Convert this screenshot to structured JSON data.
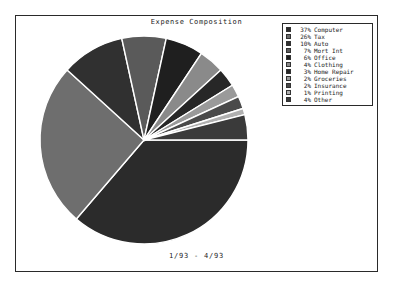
{
  "chart_data": {
    "type": "pie",
    "title": "Expense Composition",
    "caption": "1/93  -  4/93",
    "legend_position": "top-right",
    "start_angle_deg": 0,
    "direction": "clockwise",
    "categories": [
      "Computer",
      "Tax",
      "Auto",
      "Mort Int",
      "Office",
      "Clothing",
      "Home Repair",
      "Groceries",
      "Insurance",
      "Printing",
      "Other"
    ],
    "values": [
      37,
      26,
      10,
      7,
      6,
      4,
      3,
      2,
      2,
      1,
      4
    ],
    "value_suffix": "%",
    "slice_colors": [
      "#2b2b2b",
      "#6e6e6e",
      "#303030",
      "#5a5a5a",
      "#1f1f1f",
      "#8a8a8a",
      "#272727",
      "#9a9a9a",
      "#4a4a4a",
      "#b0b0b0",
      "#3a3a3a"
    ],
    "separator_color": "#ffffff"
  },
  "legend": {
    "entries": [
      {
        "pct": "37%",
        "label": "Computer",
        "color": "#2b2b2b"
      },
      {
        "pct": "26%",
        "label": "Tax",
        "color": "#6e6e6e"
      },
      {
        "pct": "10%",
        "label": "Auto",
        "color": "#303030"
      },
      {
        "pct": "7%",
        "label": "Mort Int",
        "color": "#5a5a5a"
      },
      {
        "pct": "6%",
        "label": "Office",
        "color": "#1f1f1f"
      },
      {
        "pct": "4%",
        "label": "Clothing",
        "color": "#8a8a8a"
      },
      {
        "pct": "3%",
        "label": "Home Repair",
        "color": "#272727"
      },
      {
        "pct": "2%",
        "label": "Groceries",
        "color": "#9a9a9a"
      },
      {
        "pct": "2%",
        "label": "Insurance",
        "color": "#4a4a4a"
      },
      {
        "pct": "1%",
        "label": "Printing",
        "color": "#b0b0b0"
      },
      {
        "pct": "4%",
        "label": "Other",
        "color": "#3a3a3a"
      }
    ]
  }
}
